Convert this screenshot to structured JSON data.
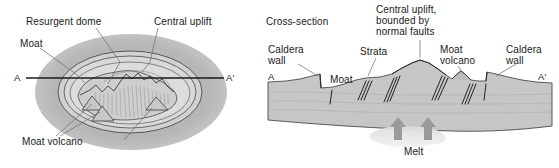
{
  "figure": {
    "colors": {
      "outer_halo": "#b8b8b8",
      "caldera_fill": "#d6d6d6",
      "dome_fill": "#cfcfcf",
      "strata_fill": "#c9c9c9",
      "ground_fill": "#c4c4c4",
      "melt_fill": "#e3e3e3",
      "line": "#3a3a3a",
      "text": "#1a1a1a",
      "background": "#ffffff"
    }
  },
  "map_view": {
    "labels": {
      "resurgent_dome": "Resurgent dome",
      "central_uplift": "Central uplift",
      "moat": "Moat",
      "moat_volcano": "Moat volcano"
    },
    "section_line": {
      "start": "A",
      "end": "A′"
    }
  },
  "cross_section": {
    "title": "Cross-section",
    "labels": {
      "central_uplift": [
        "Central uplift,",
        "bounded by",
        "normal faults"
      ],
      "caldera_wall_left": [
        "Caldera",
        "wall"
      ],
      "caldera_wall_right": [
        "Caldera",
        "wall"
      ],
      "strata": "Strata",
      "moat": "Moat",
      "moat_volcano": [
        "Moat",
        "volcano"
      ],
      "melt": "Melt"
    },
    "section_line": {
      "start": "A",
      "end": "A′"
    }
  }
}
